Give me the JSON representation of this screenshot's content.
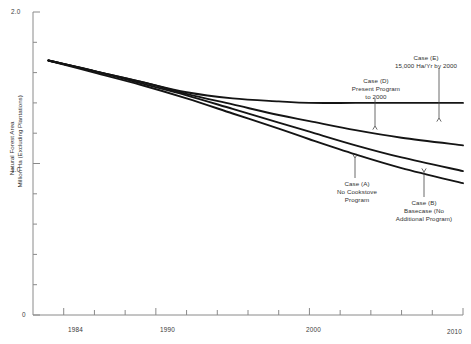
{
  "chart_data": {
    "type": "line",
    "title": "",
    "xlabel": "",
    "ylabel_line1": "Natural Forest Area",
    "ylabel_line2": "Million Ha (Excluding Plantations)",
    "xlim": [
      1982,
      2010
    ],
    "ylim": [
      0,
      2.0
    ],
    "grid": false,
    "legend_position": "none",
    "x_ticks_labeled": [
      "1984",
      "1990",
      "2000",
      "2010"
    ],
    "x_ticks_labeled_values": [
      1984,
      1990,
      2000,
      2010
    ],
    "x_minor_ticks": [
      1984,
      1986,
      1988,
      1990,
      1992,
      1994,
      1996,
      1998,
      2000,
      2002,
      2004,
      2006,
      2008,
      2010
    ],
    "y_ticks_labeled": [
      "0",
      "1.0",
      "2.0"
    ],
    "y_ticks_labeled_values": [
      0,
      1.0,
      2.0
    ],
    "y_minor_ticks": [
      0.2,
      0.4,
      0.6,
      0.8,
      1.0,
      1.2,
      1.4,
      1.6,
      1.8,
      2.0
    ],
    "line_color": "#141414",
    "axis_color": "#8a8a8a",
    "series": [
      {
        "name": "Case (E)",
        "label_line1": "Case (E)",
        "label_line2": "15,000 Ha/Yr by 2000",
        "label_line3": "",
        "x": [
          1983,
          1986,
          1989,
          1992,
          1995,
          1998,
          2000,
          2003,
          2006,
          2010
        ],
        "values": [
          1.68,
          1.61,
          1.54,
          1.47,
          1.43,
          1.41,
          1.4,
          1.4,
          1.4,
          1.4
        ]
      },
      {
        "name": "Case (D)",
        "label_line1": "Case (D)",
        "label_line2": "Present Program",
        "label_line3": "to 2000",
        "x": [
          1983,
          1986,
          1989,
          1992,
          1995,
          1998,
          2000,
          2003,
          2006,
          2010
        ],
        "values": [
          1.68,
          1.61,
          1.54,
          1.46,
          1.39,
          1.32,
          1.28,
          1.22,
          1.17,
          1.12
        ]
      },
      {
        "name": "Case (A)",
        "label_line1": "Case (A)",
        "label_line2": "No Cookstove",
        "label_line3": "Program",
        "x": [
          1983,
          1986,
          1989,
          1992,
          1995,
          1998,
          2000,
          2003,
          2006,
          2010
        ],
        "values": [
          1.68,
          1.61,
          1.53,
          1.45,
          1.36,
          1.27,
          1.21,
          1.12,
          1.04,
          0.95
        ]
      },
      {
        "name": "Case (B)",
        "label_line1": "Case (B)",
        "label_line2": "Basecase (No",
        "label_line3": "Additional Program)",
        "x": [
          1983,
          1986,
          1989,
          1992,
          1995,
          1998,
          2000,
          2003,
          2006,
          2010
        ],
        "values": [
          1.68,
          1.6,
          1.52,
          1.43,
          1.33,
          1.23,
          1.16,
          1.06,
          0.97,
          0.87
        ]
      }
    ]
  }
}
